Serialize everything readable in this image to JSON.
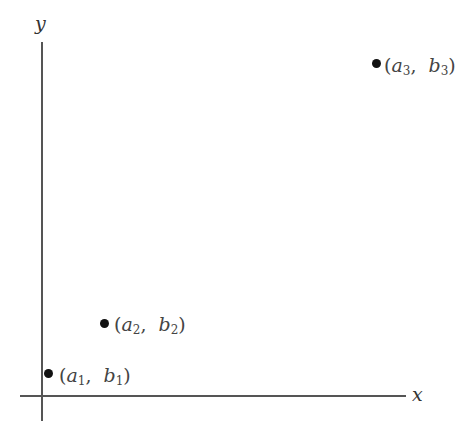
{
  "axes": {
    "x_label": "x",
    "y_label": "y"
  },
  "points": [
    {
      "a": "a",
      "a_sub": "1",
      "b": "b",
      "b_sub": "1",
      "open": "(",
      "comma": ",",
      "close": ")"
    },
    {
      "a": "a",
      "a_sub": "2",
      "b": "b",
      "b_sub": "2",
      "open": "(",
      "comma": ",",
      "close": ")"
    },
    {
      "a": "a",
      "a_sub": "3",
      "b": "b",
      "b_sub": "3",
      "open": "(",
      "comma": ",",
      "close": ")"
    }
  ]
}
